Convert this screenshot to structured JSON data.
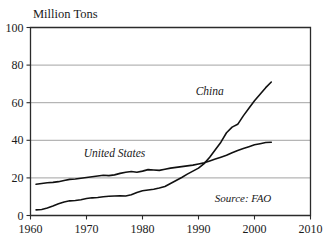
{
  "chart_data": {
    "type": "line",
    "title": "Million Tons",
    "xlabel": "",
    "ylabel": "Million Tons",
    "xlim": [
      1960,
      2010
    ],
    "ylim": [
      0,
      100
    ],
    "xticks": [
      1960,
      1970,
      1980,
      1990,
      2000,
      2010
    ],
    "yticks": [
      0,
      20,
      40,
      60,
      80,
      100
    ],
    "xtick_labels": [
      "1960",
      "1970",
      "1980",
      "1990",
      "2000",
      "2010"
    ],
    "ytick_labels": [
      "0",
      "20",
      "40",
      "60",
      "80",
      "100"
    ],
    "grid": "horizontal",
    "legend_position": "inline-labels",
    "annotations": [
      {
        "text": "China",
        "x": 1992,
        "y": 64
      },
      {
        "text": "United States",
        "x": 1975,
        "y": 31
      },
      {
        "text": "Source: FAO",
        "x": 2003,
        "y": 7
      }
    ],
    "series": [
      {
        "name": "China",
        "color": "#111111",
        "x": [
          1961,
          1962,
          1963,
          1964,
          1965,
          1966,
          1967,
          1968,
          1969,
          1970,
          1971,
          1972,
          1973,
          1974,
          1975,
          1976,
          1977,
          1978,
          1979,
          1980,
          1981,
          1982,
          1983,
          1984,
          1985,
          1986,
          1987,
          1988,
          1989,
          1990,
          1991,
          1992,
          1993,
          1994,
          1995,
          1996,
          1997,
          1998,
          1999,
          2000,
          2001,
          2002,
          2003
        ],
        "values": [
          3,
          3.2,
          4,
          5,
          6.2,
          7.2,
          7.8,
          8,
          8.4,
          9,
          9.4,
          9.6,
          10,
          10.2,
          10.4,
          10.5,
          10.4,
          11,
          12.2,
          13.2,
          13.6,
          14,
          14.6,
          15.4,
          17,
          18.6,
          20.2,
          22,
          23.6,
          25.2,
          27.6,
          31,
          35,
          39,
          44,
          47,
          48.5,
          53,
          57,
          61,
          64.5,
          68,
          71
        ]
      },
      {
        "name": "United States",
        "color": "#111111",
        "x": [
          1961,
          1962,
          1963,
          1964,
          1965,
          1966,
          1967,
          1968,
          1969,
          1970,
          1971,
          1972,
          1973,
          1974,
          1975,
          1976,
          1977,
          1978,
          1979,
          1980,
          1981,
          1982,
          1983,
          1984,
          1985,
          1986,
          1987,
          1988,
          1989,
          1990,
          1991,
          1992,
          1993,
          1994,
          1995,
          1996,
          1997,
          1998,
          1999,
          2000,
          2001,
          2002,
          2003
        ],
        "values": [
          16.6,
          17,
          17.4,
          17.6,
          18,
          18.6,
          19.2,
          19.4,
          19.8,
          20.2,
          20.6,
          21,
          21.4,
          21.2,
          21.6,
          22.4,
          23,
          23.4,
          23,
          23.6,
          24.4,
          24.2,
          24,
          24.6,
          25.2,
          25.6,
          26,
          26.4,
          26.8,
          27.4,
          28,
          29,
          30,
          31,
          32,
          33.4,
          34.6,
          35.6,
          36.6,
          37.6,
          38.2,
          38.8,
          39
        ]
      }
    ]
  }
}
